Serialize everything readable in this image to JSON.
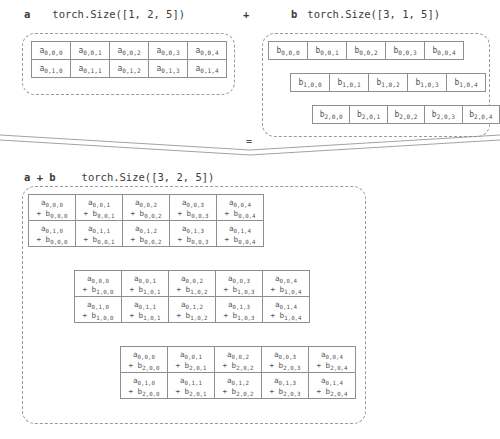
{
  "headers": {
    "a": {
      "name": "a",
      "size": "torch.Size([1, 2, 5])"
    },
    "operator": "+",
    "b": {
      "name": "b",
      "size": "torch.Size([3, 1, 5])"
    },
    "result": {
      "name": "a + b",
      "size": "torch.Size([3, 2, 5])"
    },
    "equals": "="
  },
  "colors": {
    "cell_border": "#8f8f8f",
    "dashed_border": "#9a9a9a",
    "text": "#4a4a4a",
    "background": "#ffffff",
    "connector_line": "#8a8a8a"
  },
  "tensor_a": {
    "label": "a",
    "shape": [
      1,
      2,
      5
    ],
    "rows": [
      [
        "a 0,0,0",
        "a 0,0,1",
        "a 0,0,2",
        "a 0,0,3",
        "a 0,0,4"
      ],
      [
        "a 0,1,0",
        "a 0,1,1",
        "a 0,1,2",
        "a 0,1,3",
        "a 0,1,4"
      ]
    ],
    "cells": [
      [
        {
          "base": "a",
          "sub": "0,0,0"
        },
        {
          "base": "a",
          "sub": "0,0,1"
        },
        {
          "base": "a",
          "sub": "0,0,2"
        },
        {
          "base": "a",
          "sub": "0,0,3"
        },
        {
          "base": "a",
          "sub": "0,0,4"
        }
      ],
      [
        {
          "base": "a",
          "sub": "0,1,0"
        },
        {
          "base": "a",
          "sub": "0,1,1"
        },
        {
          "base": "a",
          "sub": "0,1,2"
        },
        {
          "base": "a",
          "sub": "0,1,3"
        },
        {
          "base": "a",
          "sub": "0,1,4"
        }
      ]
    ]
  },
  "tensor_b": {
    "label": "b",
    "shape": [
      3,
      1,
      5
    ],
    "slices": [
      {
        "index": 0,
        "cells": [
          {
            "base": "b",
            "sub": "0,0,0"
          },
          {
            "base": "b",
            "sub": "0,0,1"
          },
          {
            "base": "b",
            "sub": "0,0,2"
          },
          {
            "base": "b",
            "sub": "0,0,3"
          },
          {
            "base": "b",
            "sub": "0,0,4"
          }
        ]
      },
      {
        "index": 1,
        "cells": [
          {
            "base": "b",
            "sub": "1,0,0"
          },
          {
            "base": "b",
            "sub": "1,0,1"
          },
          {
            "base": "b",
            "sub": "1,0,2"
          },
          {
            "base": "b",
            "sub": "1,0,3"
          },
          {
            "base": "b",
            "sub": "1,0,4"
          }
        ]
      },
      {
        "index": 2,
        "cells": [
          {
            "base": "b",
            "sub": "2,0,0"
          },
          {
            "base": "b",
            "sub": "2,0,1"
          },
          {
            "base": "b",
            "sub": "2,0,2"
          },
          {
            "base": "b",
            "sub": "2,0,3"
          },
          {
            "base": "b",
            "sub": "2,0,4"
          }
        ]
      }
    ]
  },
  "tensor_result": {
    "label": "a + b",
    "shape": [
      3,
      2,
      5
    ],
    "slices": [
      {
        "index": 0,
        "rows": [
          [
            {
              "a": {
                "base": "a",
                "sub": "0,0,0"
              },
              "b": {
                "base": "b",
                "sub": "0,0,0"
              }
            },
            {
              "a": {
                "base": "a",
                "sub": "0,0,1"
              },
              "b": {
                "base": "b",
                "sub": "0,0,1"
              }
            },
            {
              "a": {
                "base": "a",
                "sub": "0,0,2"
              },
              "b": {
                "base": "b",
                "sub": "0,0,2"
              }
            },
            {
              "a": {
                "base": "a",
                "sub": "0,0,3"
              },
              "b": {
                "base": "b",
                "sub": "0,0,3"
              }
            },
            {
              "a": {
                "base": "a",
                "sub": "0,0,4"
              },
              "b": {
                "base": "b",
                "sub": "0,0,4"
              }
            }
          ],
          [
            {
              "a": {
                "base": "a",
                "sub": "0,1,0"
              },
              "b": {
                "base": "b",
                "sub": "0,0,0"
              }
            },
            {
              "a": {
                "base": "a",
                "sub": "0,1,1"
              },
              "b": {
                "base": "b",
                "sub": "0,0,1"
              }
            },
            {
              "a": {
                "base": "a",
                "sub": "0,1,2"
              },
              "b": {
                "base": "b",
                "sub": "0,0,2"
              }
            },
            {
              "a": {
                "base": "a",
                "sub": "0,1,3"
              },
              "b": {
                "base": "b",
                "sub": "0,0,3"
              }
            },
            {
              "a": {
                "base": "a",
                "sub": "0,1,4"
              },
              "b": {
                "base": "b",
                "sub": "0,0,4"
              }
            }
          ]
        ]
      },
      {
        "index": 1,
        "rows": [
          [
            {
              "a": {
                "base": "a",
                "sub": "0,0,0"
              },
              "b": {
                "base": "b",
                "sub": "1,0,0"
              }
            },
            {
              "a": {
                "base": "a",
                "sub": "0,0,1"
              },
              "b": {
                "base": "b",
                "sub": "1,0,1"
              }
            },
            {
              "a": {
                "base": "a",
                "sub": "0,0,2"
              },
              "b": {
                "base": "b",
                "sub": "1,0,2"
              }
            },
            {
              "a": {
                "base": "a",
                "sub": "0,0,3"
              },
              "b": {
                "base": "b",
                "sub": "1,0,3"
              }
            },
            {
              "a": {
                "base": "a",
                "sub": "0,0,4"
              },
              "b": {
                "base": "b",
                "sub": "1,0,4"
              }
            }
          ],
          [
            {
              "a": {
                "base": "a",
                "sub": "0,1,0"
              },
              "b": {
                "base": "b",
                "sub": "1,0,0"
              }
            },
            {
              "a": {
                "base": "a",
                "sub": "0,1,1"
              },
              "b": {
                "base": "b",
                "sub": "1,0,1"
              }
            },
            {
              "a": {
                "base": "a",
                "sub": "0,1,2"
              },
              "b": {
                "base": "b",
                "sub": "1,0,2"
              }
            },
            {
              "a": {
                "base": "a",
                "sub": "0,1,3"
              },
              "b": {
                "base": "b",
                "sub": "1,0,3"
              }
            },
            {
              "a": {
                "base": "a",
                "sub": "0,1,4"
              },
              "b": {
                "base": "b",
                "sub": "1,0,4"
              }
            }
          ]
        ]
      },
      {
        "index": 2,
        "rows": [
          [
            {
              "a": {
                "base": "a",
                "sub": "0,0,0"
              },
              "b": {
                "base": "b",
                "sub": "2,0,0"
              }
            },
            {
              "a": {
                "base": "a",
                "sub": "0,0,1"
              },
              "b": {
                "base": "b",
                "sub": "2,0,1"
              }
            },
            {
              "a": {
                "base": "a",
                "sub": "0,0,2"
              },
              "b": {
                "base": "b",
                "sub": "2,0,2"
              }
            },
            {
              "a": {
                "base": "a",
                "sub": "0,0,3"
              },
              "b": {
                "base": "b",
                "sub": "2,0,3"
              }
            },
            {
              "a": {
                "base": "a",
                "sub": "0,0,4"
              },
              "b": {
                "base": "b",
                "sub": "2,0,4"
              }
            }
          ],
          [
            {
              "a": {
                "base": "a",
                "sub": "0,1,0"
              },
              "b": {
                "base": "b",
                "sub": "2,0,0"
              }
            },
            {
              "a": {
                "base": "a",
                "sub": "0,1,1"
              },
              "b": {
                "base": "b",
                "sub": "2,0,1"
              }
            },
            {
              "a": {
                "base": "a",
                "sub": "0,1,2"
              },
              "b": {
                "base": "b",
                "sub": "2,0,2"
              }
            },
            {
              "a": {
                "base": "a",
                "sub": "0,1,3"
              },
              "b": {
                "base": "b",
                "sub": "2,0,3"
              }
            },
            {
              "a": {
                "base": "a",
                "sub": "0,1,4"
              },
              "b": {
                "base": "b",
                "sub": "2,0,4"
              }
            }
          ]
        ]
      }
    ]
  }
}
